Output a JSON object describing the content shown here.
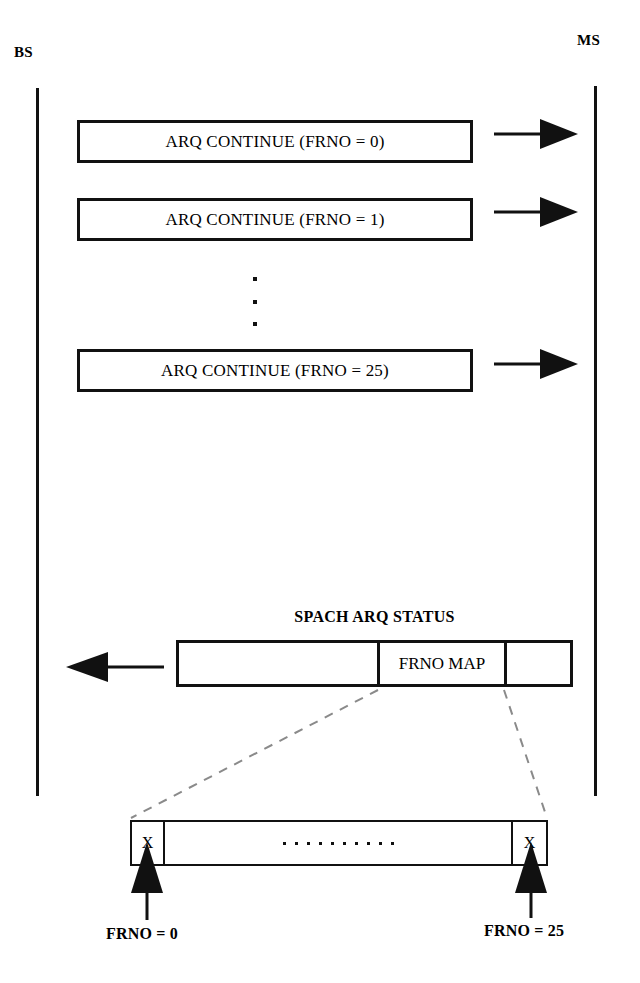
{
  "diagram": {
    "type": "message-sequence-diagram",
    "endpoints": {
      "left": "BS",
      "right": "MS"
    },
    "messages": [
      {
        "label": "ARQ CONTINUE (FRNO = 0)",
        "direction": "left-to-right"
      },
      {
        "label": "ARQ CONTINUE (FRNO = 1)",
        "direction": "left-to-right"
      },
      {
        "label": "ARQ CONTINUE (FRNO = 25)",
        "direction": "left-to-right"
      }
    ],
    "ellipsis_vertical": "· · ·",
    "status_message": {
      "title": "SPACH ARQ STATUS",
      "direction": "right-to-left",
      "fields": [
        {
          "label": ""
        },
        {
          "label": "FRNO MAP"
        },
        {
          "label": ""
        }
      ]
    },
    "frno_map_expansion": {
      "cells": [
        {
          "label": "X"
        },
        {
          "label": "dots"
        },
        {
          "label": "X"
        }
      ],
      "annotations": [
        {
          "label": "FRNO = 0",
          "position": "left"
        },
        {
          "label": "FRNO = 25",
          "position": "right"
        }
      ]
    },
    "colors": {
      "ink": "#111111",
      "paper": "#ffffff",
      "callout": "#8a8a8a"
    }
  }
}
